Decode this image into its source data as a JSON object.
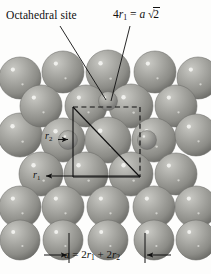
{
  "figure": {
    "background_color": "#fdfdfc",
    "line_color": "#101010",
    "sphere_fill": "#9a9a95",
    "sphere_highlight": "#d6d6d2",
    "sphere_shadow": "#6e6e6a"
  },
  "labels": {
    "octahedral_site": "Octahedral site",
    "diagonal_relation_lead": "4",
    "diagonal_relation_r": "r",
    "diagonal_relation_sub": "1",
    "diagonal_relation_eq": " = ",
    "diagonal_relation_a": "a",
    "diagonal_relation_sqrt": "√",
    "diagonal_relation_two": "2",
    "radius_large": "r",
    "radius_large_sub": "1",
    "radius_small": "r",
    "radius_small_sub": "2",
    "edge_relation_a": "a",
    "edge_relation_eq": " = 2",
    "edge_relation_r1": "r",
    "edge_relation_r1_sub": "1",
    "edge_relation_plus": " + 2",
    "edge_relation_r2": "r",
    "edge_relation_r2_sub": "2"
  },
  "geometry": {
    "unit_cell_square": {
      "x": 73,
      "y": 107,
      "width": 67,
      "height": 70,
      "solid_edges": [
        "left",
        "bottom"
      ],
      "dashed_edges": [
        "top",
        "right"
      ],
      "diagonal": "top-left to bottom-right"
    },
    "dimension_line_bottom": {
      "y": 255,
      "left_tick_x": 69,
      "right_tick_x": 145
    },
    "large_sphere_radius": 21,
    "small_sphere_radius": 9.5
  },
  "spheres": {
    "large": [
      {
        "cx": 20,
        "cy": 78,
        "r": 21
      },
      {
        "cx": 63,
        "cy": 72,
        "r": 21
      },
      {
        "cx": 108,
        "cy": 72,
        "r": 22
      },
      {
        "cx": 155,
        "cy": 72,
        "r": 21
      },
      {
        "cx": 198,
        "cy": 78,
        "r": 21
      },
      {
        "cx": 20,
        "cy": 135,
        "r": 22
      },
      {
        "cx": 41,
        "cy": 106,
        "r": 21
      },
      {
        "cx": 86,
        "cy": 106,
        "r": 21
      },
      {
        "cx": 131,
        "cy": 106,
        "r": 22
      },
      {
        "cx": 176,
        "cy": 106,
        "r": 21
      },
      {
        "cx": 63,
        "cy": 140,
        "r": 22
      },
      {
        "cx": 108,
        "cy": 140,
        "r": 23
      },
      {
        "cx": 154,
        "cy": 140,
        "r": 22
      },
      {
        "cx": 196,
        "cy": 135,
        "r": 21
      },
      {
        "cx": 41,
        "cy": 174,
        "r": 22
      },
      {
        "cx": 86,
        "cy": 174,
        "r": 22
      },
      {
        "cx": 131,
        "cy": 174,
        "r": 22
      },
      {
        "cx": 176,
        "cy": 174,
        "r": 21
      },
      {
        "cx": 20,
        "cy": 207,
        "r": 21
      },
      {
        "cx": 63,
        "cy": 207,
        "r": 21
      },
      {
        "cx": 108,
        "cy": 207,
        "r": 21
      },
      {
        "cx": 154,
        "cy": 207,
        "r": 21
      },
      {
        "cx": 196,
        "cy": 207,
        "r": 21
      },
      {
        "cx": 20,
        "cy": 240,
        "r": 20
      },
      {
        "cx": 63,
        "cy": 240,
        "r": 20
      },
      {
        "cx": 108,
        "cy": 240,
        "r": 20
      },
      {
        "cx": 154,
        "cy": 240,
        "r": 20
      },
      {
        "cx": 196,
        "cy": 240,
        "r": 20
      }
    ],
    "small": [
      {
        "cx": 108,
        "cy": 101,
        "r": 9.5,
        "role": "octahedral-site"
      },
      {
        "cx": 68,
        "cy": 140,
        "r": 9.5,
        "role": "interstitial"
      },
      {
        "cx": 147,
        "cy": 140,
        "r": 9.5,
        "role": "interstitial"
      }
    ]
  },
  "leaders": [
    {
      "name": "octahedral-site-leader",
      "x1": 60,
      "y1": 26,
      "x2": 106,
      "y2": 100
    },
    {
      "name": "diagonal-relation-leader",
      "x1": 130,
      "y1": 26,
      "x2": 111,
      "y2": 101
    }
  ]
}
